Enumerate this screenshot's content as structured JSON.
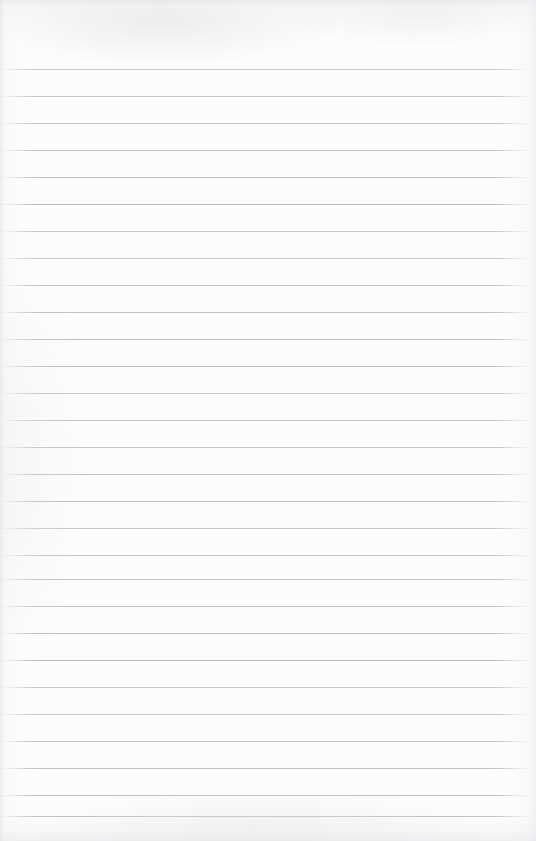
{
  "document": {
    "kind": "scanned-ruled-notebook-page",
    "content_text": "",
    "page_width": 536,
    "page_height": 841
  },
  "paper": {
    "background_color": "#fdfdfd",
    "edge_shade_color": "#e2e4e7"
  },
  "ruling": {
    "line_color": "#b9bdc2",
    "line_thickness_px": 1,
    "line_spacing_px": 27,
    "first_line_y": 69,
    "line_left_x": 0,
    "line_right_x": 529,
    "line_count": 28,
    "lines": [
      {
        "y": 69
      },
      {
        "y": 96
      },
      {
        "y": 123
      },
      {
        "y": 150
      },
      {
        "y": 177
      },
      {
        "y": 204
      },
      {
        "y": 231
      },
      {
        "y": 258
      },
      {
        "y": 285
      },
      {
        "y": 312
      },
      {
        "y": 339
      },
      {
        "y": 366
      },
      {
        "y": 393
      },
      {
        "y": 420
      },
      {
        "y": 447
      },
      {
        "y": 474
      },
      {
        "y": 501
      },
      {
        "y": 528
      },
      {
        "y": 555
      },
      {
        "y": 579
      },
      {
        "y": 606
      },
      {
        "y": 633
      },
      {
        "y": 660
      },
      {
        "y": 687
      },
      {
        "y": 714
      },
      {
        "y": 741
      },
      {
        "y": 768
      },
      {
        "y": 795
      },
      {
        "y": 816
      }
    ]
  }
}
